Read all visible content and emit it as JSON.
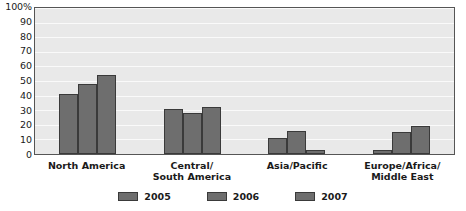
{
  "chart_data": {
    "type": "bar",
    "title": "",
    "xlabel": "",
    "ylabel": "",
    "ylim": [
      0,
      100
    ],
    "yticks": [
      "100%",
      "90",
      "80",
      "70",
      "60",
      "50",
      "40",
      "30",
      "20",
      "10",
      "0"
    ],
    "ytick_values": [
      100,
      90,
      80,
      70,
      60,
      50,
      40,
      30,
      20,
      10,
      0
    ],
    "grid": true,
    "legend_position": "bottom-center",
    "categories": [
      "North America",
      "Central/\nSouth America",
      "Asia/Pacific",
      "Europe/Africa/\nMiddle East"
    ],
    "category_lines": [
      [
        "North America"
      ],
      [
        "Central/",
        "South America"
      ],
      [
        "Asia/Pacific"
      ],
      [
        "Europe/Africa/",
        "Middle East"
      ]
    ],
    "series": [
      {
        "name": "2005",
        "color": "#6e6e6e",
        "values": [
          41,
          31,
          11,
          3
        ]
      },
      {
        "name": "2006",
        "color": "#6e6e6e",
        "values": [
          48,
          28,
          16,
          15
        ]
      },
      {
        "name": "2007",
        "color": "#6e6e6e",
        "values": [
          54,
          32,
          3,
          19
        ]
      }
    ]
  },
  "colors": {
    "bar_fill": "#6e6e6e",
    "bar_outline": "#3a3a3a",
    "plot_background": "#e9e9e9",
    "plot_border": "#555555",
    "gridline": "#fafafa",
    "text": "#1a1a1a"
  },
  "legend": {
    "entries": [
      {
        "label": "2005"
      },
      {
        "label": "2006"
      },
      {
        "label": "2007"
      }
    ]
  }
}
